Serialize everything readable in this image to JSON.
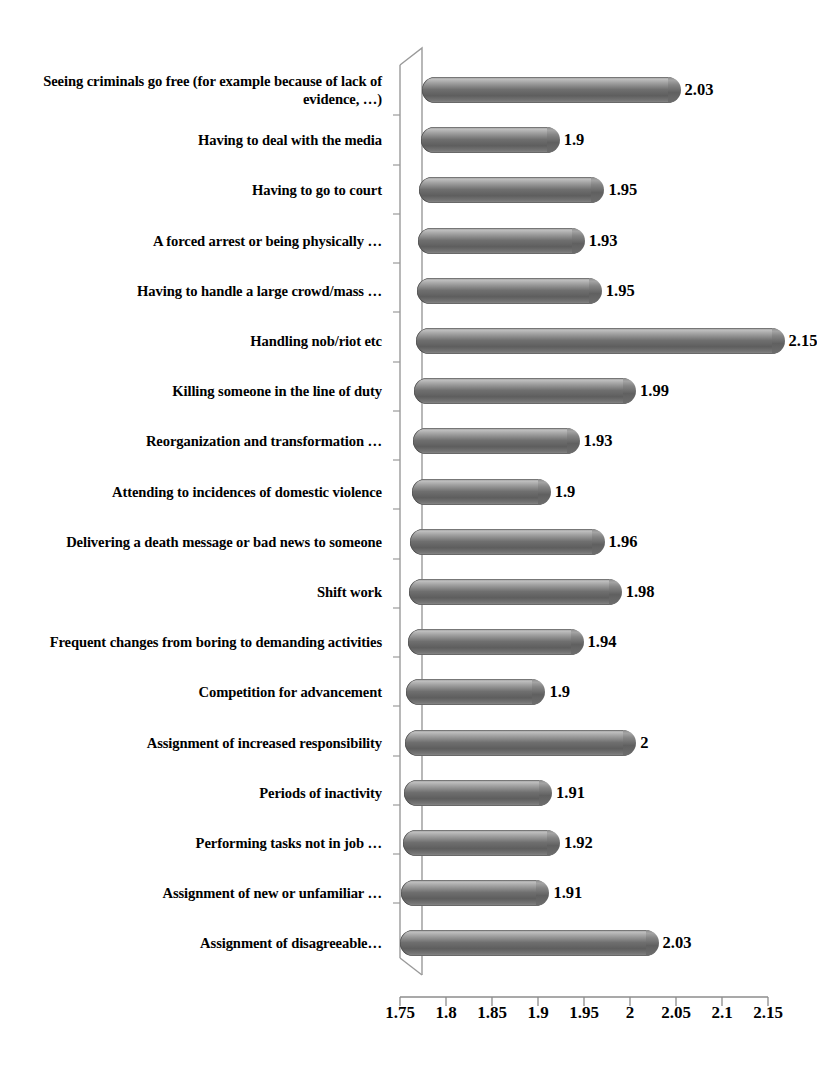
{
  "chart_data": {
    "type": "bar",
    "orientation": "horizontal",
    "title": "",
    "xlabel": "",
    "ylabel": "",
    "xlim": [
      1.75,
      2.15
    ],
    "grid": false,
    "legend": null,
    "xticks": [
      "1.75",
      "1.8",
      "1.85",
      "1.9",
      "1.95",
      "2",
      "2.05",
      "2.1",
      "2.15"
    ],
    "xtick_values": [
      1.75,
      1.8,
      1.85,
      1.9,
      1.95,
      2.0,
      2.05,
      2.1,
      2.15
    ],
    "bar_color": "#6f6f6f",
    "categories": [
      "Seeing criminals go free (for example because of lack of evidence, …)",
      "Having to deal with the media",
      "Having to go to court",
      "A forced arrest or being physically …",
      "Having to handle a large crowd/mass …",
      "Handling nob/riot etc",
      "Killing someone in the line of duty",
      "Reorganization and transformation …",
      "Attending to incidences of domestic violence",
      "Delivering a death message or bad news to someone",
      "Shift work",
      "Frequent changes from boring to demanding activities",
      "Competition for advancement",
      "Assignment of increased responsibility",
      "Periods of inactivity",
      "Performing tasks not in job …",
      "Assignment of new or unfamiliar …",
      "Assignment of disagreeable…"
    ],
    "values": [
      2.03,
      1.9,
      1.95,
      1.93,
      1.95,
      2.15,
      1.99,
      1.93,
      1.9,
      1.96,
      1.98,
      1.94,
      1.9,
      2,
      1.91,
      1.92,
      1.91,
      2.03
    ],
    "value_labels": [
      "2.03",
      "1.9",
      "1.95",
      "1.93",
      "1.95",
      "2.15",
      "1.99",
      "1.93",
      "1.9",
      "1.96",
      "1.98",
      "1.94",
      "1.9",
      "2",
      "1.91",
      "1.92",
      "1.91",
      "2.03"
    ]
  }
}
